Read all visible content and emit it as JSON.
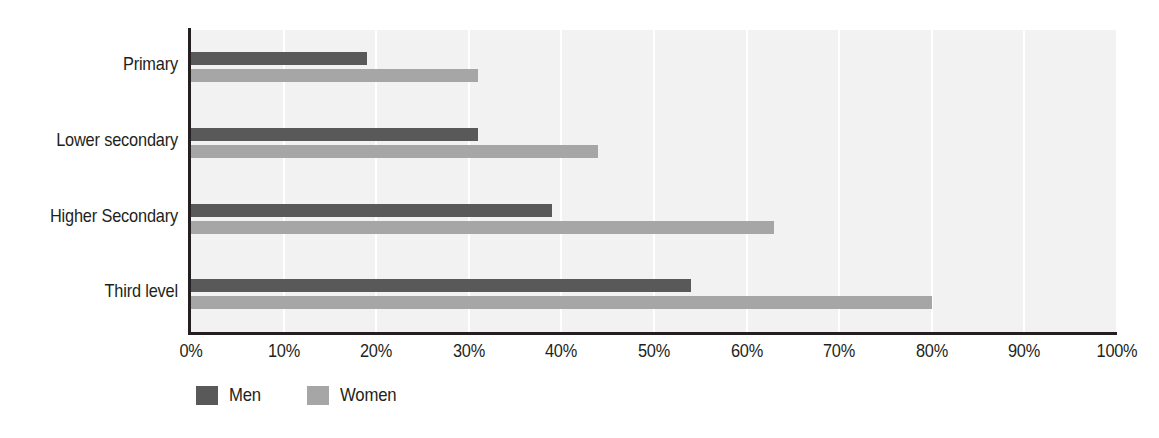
{
  "chart_data": {
    "type": "bar",
    "orientation": "horizontal",
    "title": "",
    "subtitle": "",
    "xlabel": "",
    "ylabel": "",
    "xlim": [
      0,
      100
    ],
    "xtick_labels": [
      "0%",
      "10%",
      "20%",
      "30%",
      "40%",
      "50%",
      "60%",
      "70%",
      "80%",
      "90%",
      "100%"
    ],
    "xtick_values": [
      0,
      10,
      20,
      30,
      40,
      50,
      60,
      70,
      80,
      90,
      100
    ],
    "categories": [
      "Primary",
      "Lower secondary",
      "Higher Secondary",
      "Third level"
    ],
    "series": [
      {
        "name": "Men",
        "color": "#595959",
        "values": [
          19,
          31,
          39,
          54
        ]
      },
      {
        "name": "Women",
        "color": "#a6a6a6",
        "values": [
          31,
          44,
          63,
          80
        ]
      }
    ],
    "legend": {
      "position": "bottom-left",
      "entries": [
        {
          "label": "Men",
          "color": "#595959"
        },
        {
          "label": "Women",
          "color": "#a6a6a6"
        }
      ]
    },
    "grid": {
      "vertical": true,
      "horizontal": false,
      "color": "#ffffff"
    },
    "plot_background": "#f2f2f2",
    "axis_color": "#231f20",
    "units": "percent"
  }
}
